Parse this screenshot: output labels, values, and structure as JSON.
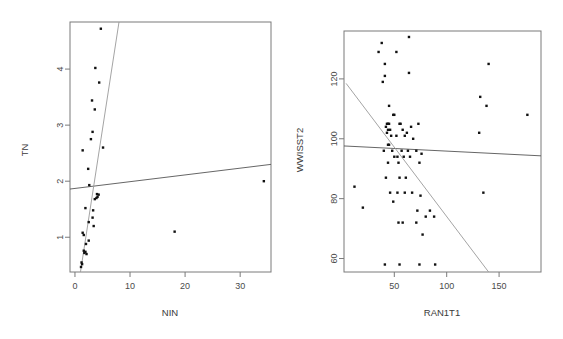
{
  "figure": {
    "type": "scatterplot-matrix-pair",
    "background": "#ffffff",
    "point_color": "#111111",
    "line_color": "#555555"
  },
  "chart_data": [
    {
      "type": "scatter",
      "panel": "left",
      "title": "",
      "xlabel": "NIN",
      "ylabel": "TN",
      "xticks": [
        0,
        10,
        20,
        30
      ],
      "yticks": [
        1,
        2,
        3,
        4
      ],
      "xlim": [
        -0.9,
        35.6
      ],
      "ylim": [
        0.38,
        4.84
      ],
      "grid": false,
      "legend": "none",
      "points": [
        [
          4.7,
          4.72
        ],
        [
          3.7,
          4.02
        ],
        [
          4.4,
          3.76
        ],
        [
          3.1,
          3.44
        ],
        [
          3.6,
          3.28
        ],
        [
          3.2,
          2.88
        ],
        [
          2.9,
          2.75
        ],
        [
          5.1,
          2.6
        ],
        [
          1.4,
          2.55
        ],
        [
          2.4,
          2.22
        ],
        [
          2.6,
          1.93
        ],
        [
          4.0,
          1.77
        ],
        [
          4.3,
          1.76
        ],
        [
          4.1,
          1.72
        ],
        [
          3.9,
          1.7
        ],
        [
          3.6,
          1.68
        ],
        [
          1.9,
          1.52
        ],
        [
          3.3,
          1.48
        ],
        [
          34.3,
          2.0
        ],
        [
          3.2,
          1.35
        ],
        [
          2.5,
          1.27
        ],
        [
          3.4,
          1.2
        ],
        [
          1.4,
          1.08
        ],
        [
          1.6,
          1.04
        ],
        [
          18.1,
          1.1
        ],
        [
          2.5,
          0.94
        ],
        [
          2.0,
          0.88
        ],
        [
          1.6,
          0.76
        ],
        [
          1.9,
          0.74
        ],
        [
          1.7,
          0.72
        ],
        [
          2.1,
          0.7
        ],
        [
          1.2,
          0.55
        ],
        [
          1.3,
          0.52
        ],
        [
          1.1,
          0.47
        ]
      ],
      "lines": [
        {
          "name": "shallow-fit",
          "from": [
            -0.9,
            1.86
          ],
          "to": [
            35.6,
            2.3
          ]
        },
        {
          "name": "steep-fit",
          "from": [
            1.0,
            0.38
          ],
          "to": [
            8.0,
            4.84
          ]
        }
      ]
    },
    {
      "type": "scatter",
      "panel": "right",
      "title": "",
      "xlabel": "RAN1T1",
      "ylabel": "WWISST2",
      "xticks": [
        50,
        100,
        150
      ],
      "yticks": [
        60,
        80,
        100,
        120
      ],
      "xlim": [
        2,
        190
      ],
      "ylim": [
        55.5,
        136.0
      ],
      "grid": false,
      "legend": "none",
      "points": [
        [
          64,
          134
        ],
        [
          38,
          132
        ],
        [
          35,
          129
        ],
        [
          52,
          129
        ],
        [
          41,
          125
        ],
        [
          64,
          122
        ],
        [
          41,
          121
        ],
        [
          140,
          125
        ],
        [
          39,
          119
        ],
        [
          132,
          114
        ],
        [
          45,
          111
        ],
        [
          138,
          111
        ],
        [
          49,
          108
        ],
        [
          50,
          108
        ],
        [
          177,
          108
        ],
        [
          43,
          105
        ],
        [
          44,
          105
        ],
        [
          45,
          105
        ],
        [
          42,
          104
        ],
        [
          55,
          105
        ],
        [
          56,
          105
        ],
        [
          73,
          105
        ],
        [
          66,
          104
        ],
        [
          44,
          103
        ],
        [
          46,
          103
        ],
        [
          58,
          103
        ],
        [
          62,
          102
        ],
        [
          131,
          102
        ],
        [
          43,
          102
        ],
        [
          47,
          101
        ],
        [
          52,
          101
        ],
        [
          60,
          101
        ],
        [
          68,
          100
        ],
        [
          44,
          98
        ],
        [
          45,
          98
        ],
        [
          40,
          96
        ],
        [
          48,
          96
        ],
        [
          57,
          96
        ],
        [
          63,
          96
        ],
        [
          71,
          96
        ],
        [
          76,
          95
        ],
        [
          50,
          94
        ],
        [
          53,
          94
        ],
        [
          59,
          94
        ],
        [
          65,
          94
        ],
        [
          44,
          92
        ],
        [
          54,
          92
        ],
        [
          74,
          92
        ],
        [
          42,
          87
        ],
        [
          55,
          87
        ],
        [
          61,
          87
        ],
        [
          12,
          84
        ],
        [
          46,
          82
        ],
        [
          53,
          82
        ],
        [
          60,
          82
        ],
        [
          67,
          82
        ],
        [
          135,
          82
        ],
        [
          75,
          81
        ],
        [
          49,
          79
        ],
        [
          20,
          77
        ],
        [
          72,
          76
        ],
        [
          84,
          76
        ],
        [
          80,
          74
        ],
        [
          88,
          74
        ],
        [
          54,
          72
        ],
        [
          58,
          72
        ],
        [
          71,
          72
        ],
        [
          77,
          68
        ],
        [
          41,
          58
        ],
        [
          55,
          58
        ],
        [
          74,
          58
        ],
        [
          89,
          58
        ]
      ],
      "lines": [
        {
          "name": "shallow-fit",
          "from": [
            2,
            97.6
          ],
          "to": [
            190,
            94.3
          ]
        },
        {
          "name": "steep-fit",
          "from": [
            4,
            118.5
          ],
          "to": [
            140,
            55.5
          ]
        }
      ]
    }
  ]
}
